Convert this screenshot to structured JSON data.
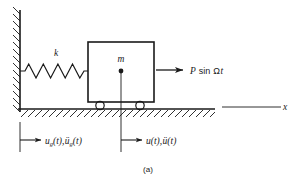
{
  "figure": {
    "caption": "(a)",
    "type": "mechanical-schematic"
  },
  "labels": {
    "spring_stiffness": "k",
    "mass": "m",
    "applied_force": "P sin Ωt",
    "ground_displacement": "u₉(t),ü₉(t)",
    "mass_displacement": "u(t),ü(t)",
    "axis_x": "x"
  },
  "label_parts": {
    "ground_u": "u",
    "ground_sub": "g",
    "ground_paren": "(t),",
    "ground_uddot": "ü",
    "ground_sub2": "g",
    "ground_paren2": "(t)",
    "mass_u": "u",
    "mass_paren": "(t),",
    "mass_uddot": "ü",
    "mass_paren2": "(t)",
    "force_P": "P",
    "force_sin": "sin",
    "force_omega": "Ω",
    "force_t": "t"
  },
  "colors": {
    "stroke": "#1a1a1a",
    "background": "#ffffff",
    "fill_none": "none"
  },
  "geometry": {
    "wall_x": 20,
    "wall_top": 10,
    "ground_y": 109,
    "ground_left": 18,
    "ground_right": 215,
    "axis_right": 281,
    "block_left": 88,
    "block_right": 154,
    "block_top": 42,
    "block_bottom": 102,
    "mass_center_x": 121,
    "mass_dot_y": 71,
    "spring_y": 71,
    "spring_coils": 9,
    "wheel_left_x": 100,
    "wheel_right_x": 140,
    "wheel_r": 4,
    "dim_line_y_top": 118,
    "dim_line_y_bottom": 152,
    "force_arrow_start": 156,
    "force_arrow_end": 184
  }
}
